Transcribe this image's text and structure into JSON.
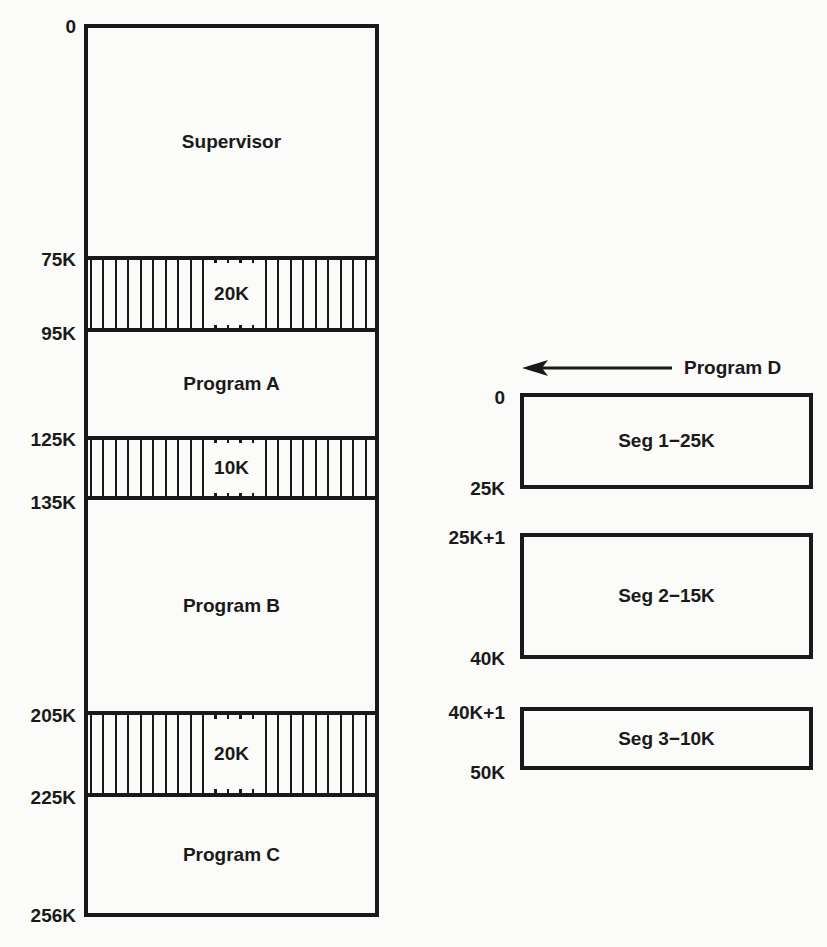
{
  "memory_map": {
    "addresses": [
      "0",
      "75K",
      "95K",
      "125K",
      "135K",
      "205K",
      "225K",
      "256K"
    ],
    "regions": [
      {
        "label": "Supervisor",
        "start": "0",
        "end": "75K",
        "type": "allocated"
      },
      {
        "label": "20K",
        "start": "75K",
        "end": "95K",
        "type": "free"
      },
      {
        "label": "Program A",
        "start": "95K",
        "end": "125K",
        "type": "allocated"
      },
      {
        "label": "10K",
        "start": "125K",
        "end": "135K",
        "type": "free"
      },
      {
        "label": "Program B",
        "start": "135K",
        "end": "205K",
        "type": "allocated"
      },
      {
        "label": "20K",
        "start": "205K",
        "end": "225K",
        "type": "free"
      },
      {
        "label": "Program C",
        "start": "225K",
        "end": "256K",
        "type": "allocated"
      }
    ]
  },
  "program_d": {
    "label": "Program D",
    "arrow_icon": "left-arrow-icon",
    "segments": [
      {
        "label": "Seg 1−25K",
        "start": "0",
        "end": "25K"
      },
      {
        "label": "Seg 2−15K",
        "start": "25K+1",
        "end": "40K"
      },
      {
        "label": "Seg 3−10K",
        "start": "40K+1",
        "end": "50K"
      }
    ]
  },
  "colors": {
    "ink": "#1a1a1a",
    "paper": "#fbfbf9"
  }
}
